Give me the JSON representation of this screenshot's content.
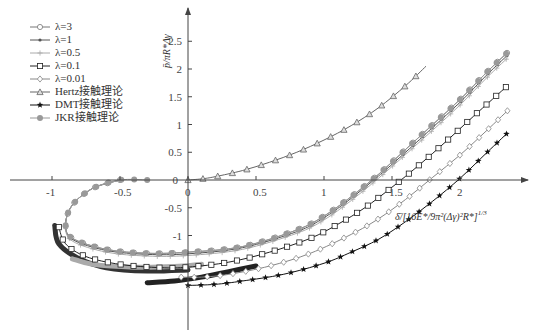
{
  "chart_data": {
    "type": "line",
    "title": "",
    "xlabel": "δ̄/[16E*/9π²(Δγ)²R*]^1/3",
    "ylabel": "p̄/πR*Δγ",
    "xlim": [
      -1.35,
      2.4
    ],
    "ylim": [
      -1.9,
      2.9
    ],
    "x_ticks": [
      -1,
      -0.5,
      0,
      0.5,
      1,
      1.5,
      2
    ],
    "y_ticks": [
      -1,
      -0.5,
      0,
      0.5,
      1,
      1.5,
      2,
      2.5
    ],
    "legend_position": "upper-left",
    "grid": false,
    "series": [
      {
        "name": "λ=3",
        "marker": "circle",
        "color": "#777777",
        "x": [
          -0.5,
          -0.7,
          -0.85,
          -0.9,
          -0.85,
          -0.6,
          -0.3,
          0,
          0.4,
          0.8,
          1.0,
          1.2,
          1.4,
          1.6,
          1.8,
          2.0,
          2.2,
          2.35
        ],
        "y": [
          0,
          -0.15,
          -0.45,
          -0.8,
          -1.05,
          -1.25,
          -1.32,
          -1.3,
          -1.2,
          -0.9,
          -0.65,
          -0.3,
          0.1,
          0.55,
          1.0,
          1.45,
          1.95,
          2.3
        ]
      },
      {
        "name": "λ=1",
        "marker": "dot",
        "color": "#555555",
        "x": [
          -0.5,
          -0.7,
          -0.85,
          -0.9,
          -0.85,
          -0.6,
          -0.3,
          0,
          0.4,
          0.8,
          1.0,
          1.2,
          1.4,
          1.6,
          1.8,
          2.0,
          2.2,
          2.35
        ],
        "y": [
          0,
          -0.15,
          -0.45,
          -0.8,
          -1.07,
          -1.27,
          -1.34,
          -1.33,
          -1.22,
          -0.93,
          -0.68,
          -0.33,
          0.07,
          0.5,
          0.95,
          1.4,
          1.9,
          2.25
        ]
      },
      {
        "name": "λ=0.5",
        "marker": "plus",
        "color": "#aaaaaa",
        "x": [
          -0.5,
          -0.7,
          -0.85,
          -0.9,
          -0.85,
          -0.6,
          -0.3,
          0,
          0.4,
          0.8,
          1.0,
          1.2,
          1.4,
          1.6,
          1.8,
          2.0,
          2.2,
          2.35
        ],
        "y": [
          0,
          -0.15,
          -0.45,
          -0.82,
          -1.1,
          -1.3,
          -1.37,
          -1.36,
          -1.25,
          -0.96,
          -0.72,
          -0.37,
          0.03,
          0.46,
          0.9,
          1.35,
          1.85,
          2.2
        ]
      },
      {
        "name": "λ=0.1",
        "marker": "square",
        "color": "#222222",
        "x": [
          -0.95,
          -0.9,
          -0.75,
          -0.5,
          -0.2,
          0,
          0.3,
          0.6,
          0.9,
          1.1,
          1.3,
          1.5,
          1.7,
          1.9,
          2.1,
          2.35
        ],
        "y": [
          -0.85,
          -1.15,
          -1.38,
          -1.52,
          -1.58,
          -1.57,
          -1.48,
          -1.3,
          -1.05,
          -0.8,
          -0.5,
          -0.13,
          0.27,
          0.7,
          1.15,
          1.7
        ]
      },
      {
        "name": "λ=0.01",
        "marker": "diamond",
        "color": "#888888",
        "x": [
          -0.05,
          0.1,
          0.3,
          0.6,
          0.9,
          1.2,
          1.4,
          1.6,
          1.8,
          2.0,
          2.2,
          2.35
        ],
        "y": [
          -1.75,
          -1.75,
          -1.7,
          -1.55,
          -1.32,
          -0.98,
          -0.7,
          -0.35,
          0.05,
          0.45,
          0.9,
          1.25
        ]
      },
      {
        "name": "Hertz接触理论",
        "marker": "triangle",
        "color": "#666666",
        "x": [
          0,
          0.1,
          0.2,
          0.4,
          0.6,
          0.8,
          1.0,
          1.2,
          1.4,
          1.6,
          1.75
        ],
        "y": [
          0,
          0.02,
          0.06,
          0.17,
          0.32,
          0.5,
          0.72,
          0.98,
          1.3,
          1.7,
          2.05
        ]
      },
      {
        "name": "DMT接触理论",
        "marker": "star",
        "color": "#111111",
        "x": [
          0,
          0.2,
          0.4,
          0.7,
          1.0,
          1.2,
          1.4,
          1.6,
          1.8,
          2.0,
          2.2,
          2.35
        ],
        "y": [
          -1.9,
          -1.88,
          -1.82,
          -1.7,
          -1.5,
          -1.3,
          -1.07,
          -0.75,
          -0.38,
          0.03,
          0.5,
          0.85
        ]
      },
      {
        "name": "JKR接触理论",
        "marker": "hexagon",
        "color": "#999999",
        "x": [
          -0.3,
          -0.5,
          -0.7,
          -0.85,
          -0.9,
          -0.85,
          -0.6,
          -0.3,
          0,
          0.4,
          0.8,
          1.0,
          1.2,
          1.4,
          1.6,
          1.8,
          2.0,
          2.2,
          2.35
        ],
        "y": [
          0,
          0,
          -0.15,
          -0.45,
          -0.8,
          -1.05,
          -1.25,
          -1.32,
          -1.3,
          -1.2,
          -0.9,
          -0.65,
          -0.3,
          0.1,
          0.55,
          1.0,
          1.45,
          1.95,
          2.3
        ]
      }
    ],
    "extra_bands": [
      {
        "desc": "dark thick band",
        "x": [
          -0.98,
          -0.95,
          -0.8,
          -0.6,
          -0.3,
          0.0
        ],
        "y": [
          -0.82,
          -1.15,
          -1.42,
          -1.58,
          -1.64,
          -1.62
        ]
      },
      {
        "desc": "grey thick band",
        "x": [
          -0.85,
          -0.7,
          -0.4,
          -0.1,
          0.1
        ],
        "y": [
          -1.42,
          -1.52,
          -1.57,
          -1.56,
          -1.52
        ]
      },
      {
        "desc": "black thick band",
        "x": [
          -0.3,
          -0.1,
          0.1,
          0.3,
          0.5
        ],
        "y": [
          -1.85,
          -1.82,
          -1.75,
          -1.65,
          -1.55
        ]
      }
    ]
  },
  "legend": {
    "items": [
      {
        "label": "λ=3",
        "marker": "circle"
      },
      {
        "label": "λ=1",
        "marker": "dot"
      },
      {
        "label": "λ=0.5",
        "marker": "plus"
      },
      {
        "label": "λ=0.1",
        "marker": "square"
      },
      {
        "label": "λ=0.01",
        "marker": "diamond"
      },
      {
        "label": "Hertz接触理论",
        "marker": "triangle"
      },
      {
        "label": "DMT接触理论",
        "marker": "star"
      },
      {
        "label": "JKR接触理论",
        "marker": "hexagon"
      }
    ]
  },
  "labels": {
    "y_axis": "p̄/πR*Δγ",
    "x_axis": "δ̄/[16E*/9π²(Δγ)²R*]",
    "x_axis_exp": "1/3"
  }
}
